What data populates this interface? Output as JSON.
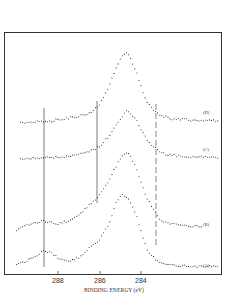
{
  "chart_data": {
    "type": "line",
    "title": "",
    "xlabel": "BINDING ENERGY (eV)",
    "ylabel": "",
    "x_reversed": true,
    "xlim": [
      290.2,
      279.5
    ],
    "xticks": [
      288,
      286,
      284
    ],
    "grid": false,
    "legend_position": "inline-right",
    "reference_lines": [
      {
        "x": 288.7,
        "style": "solid"
      },
      {
        "x": 286.2,
        "style": "solid"
      },
      {
        "x": 283.6,
        "style": "dashed"
      }
    ],
    "series": [
      {
        "name": "(A)",
        "offset": 0,
        "marker": "dots",
        "x": [
          290.0,
          289.5,
          289.0,
          288.7,
          288.3,
          288.0,
          287.5,
          287.0,
          286.5,
          286.0,
          285.5,
          285.2,
          284.9,
          284.7,
          284.5,
          284.2,
          284.0,
          283.7,
          283.3,
          283.0,
          282.5,
          282.0,
          281.5,
          281.0,
          280.5,
          280.2
        ],
        "y": [
          0.05,
          0.1,
          0.18,
          0.25,
          0.2,
          0.14,
          0.1,
          0.14,
          0.28,
          0.38,
          0.62,
          0.9,
          1.0,
          0.98,
          0.9,
          0.7,
          0.5,
          0.25,
          0.12,
          0.06,
          0.04,
          0.03,
          0.02,
          0.02,
          0.02,
          0.02
        ]
      },
      {
        "name": "(B)",
        "offset": 1,
        "marker": "dots",
        "x": [
          290.0,
          289.5,
          289.0,
          288.7,
          288.3,
          288.0,
          287.5,
          287.0,
          286.5,
          286.0,
          285.5,
          285.2,
          284.9,
          284.7,
          284.5,
          284.2,
          284.0,
          283.7,
          283.3,
          283.0,
          282.5,
          282.0,
          281.5,
          281.0
        ],
        "y": [
          0.0,
          0.06,
          0.1,
          0.12,
          0.1,
          0.08,
          0.12,
          0.2,
          0.32,
          0.45,
          0.65,
          0.82,
          0.95,
          1.0,
          0.95,
          0.78,
          0.6,
          0.4,
          0.22,
          0.12,
          0.08,
          0.06,
          0.05,
          0.04
        ]
      },
      {
        "name": "(C)",
        "offset": 2,
        "marker": "dots",
        "x": [
          289.8,
          289.5,
          289.0,
          288.7,
          288.3,
          288.0,
          287.5,
          287.0,
          286.5,
          286.0,
          285.5,
          285.2,
          284.9,
          284.7,
          284.5,
          284.2,
          284.0,
          283.7,
          283.3,
          283.0,
          282.5,
          282.0,
          281.5,
          281.0,
          280.5,
          280.2
        ],
        "y": [
          0.0,
          0.02,
          0.02,
          0.03,
          0.02,
          0.04,
          0.06,
          0.1,
          0.16,
          0.26,
          0.5,
          0.72,
          0.9,
          1.0,
          0.95,
          0.8,
          0.62,
          0.38,
          0.22,
          0.12,
          0.08,
          0.05,
          0.04,
          0.04,
          0.03,
          0.03
        ]
      },
      {
        "name": "(D)",
        "offset": 3,
        "marker": "dots",
        "x": [
          289.8,
          289.5,
          289.0,
          288.7,
          288.3,
          288.0,
          287.5,
          287.0,
          286.5,
          286.0,
          285.5,
          285.2,
          284.9,
          284.7,
          284.5,
          284.2,
          284.0,
          283.7,
          283.3,
          283.0,
          282.5,
          282.0,
          281.5,
          281.0,
          280.5,
          280.2
        ],
        "y": [
          0.0,
          0.01,
          0.02,
          0.03,
          0.03,
          0.05,
          0.07,
          0.1,
          0.14,
          0.26,
          0.55,
          0.8,
          0.96,
          1.0,
          0.92,
          0.72,
          0.52,
          0.3,
          0.16,
          0.1,
          0.06,
          0.05,
          0.04,
          0.04,
          0.03,
          0.03
        ]
      }
    ]
  },
  "axis": {
    "tick_288": "288",
    "tick_286": "286",
    "tick_284": "284",
    "xlabel": "BINDING ENERGY (eV)"
  },
  "labels": {
    "A": "(A)",
    "B": "(B)",
    "C": "(C)",
    "D": "(D)"
  },
  "colors": {
    "ink": "#2a2a2a",
    "frame": "#333333",
    "background": "#ffffff"
  }
}
